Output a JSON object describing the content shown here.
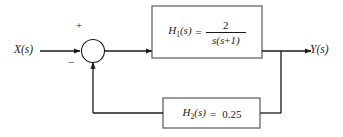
{
  "diagram": {
    "background_color": "#ffffff",
    "line_color": "#1a1a1a",
    "input": {
      "label": "X(s)",
      "name": "input-signal"
    },
    "output": {
      "label": "Y(s)",
      "name": "output-signal"
    },
    "summing_junction": {
      "name": "summing-junction",
      "plus_sign": "+",
      "minus_sign": "−"
    },
    "forward_block": {
      "name": "H1",
      "label_html": "H1(s)",
      "label_base": "H",
      "label_sub": "1",
      "label_arg": "(s)",
      "equals": "=",
      "numerator": "2",
      "denominator": "s(s+1)",
      "denominator_base": "s(s",
      "denominator_op": "+",
      "denominator_tail": "1)",
      "full_expression": "H1(s) = 2 / s(s+1)"
    },
    "feedback_block": {
      "name": "H2",
      "label_base": "H",
      "label_sub": "2",
      "label_arg": "(s)",
      "equals": "=",
      "value": "0.25",
      "full_expression": "H2(s) = 0.25"
    }
  }
}
